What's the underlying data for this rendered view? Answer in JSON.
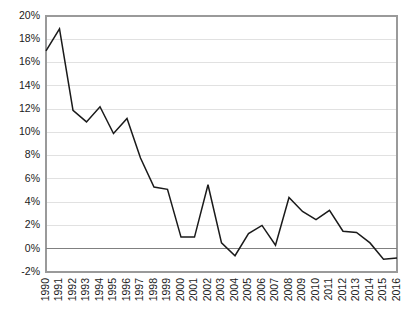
{
  "chart_data": {
    "type": "line",
    "title": "",
    "subtitle": "",
    "xlabel": "",
    "ylabel": "",
    "x": [
      1990,
      1991,
      1992,
      1993,
      1994,
      1995,
      1996,
      1997,
      1998,
      1999,
      2000,
      2001,
      2002,
      2003,
      2004,
      2005,
      2006,
      2007,
      2008,
      2009,
      2010,
      2011,
      2012,
      2013,
      2014,
      2015,
      2016
    ],
    "categories": [
      "1990",
      "1991",
      "1992",
      "1993",
      "1994",
      "1995",
      "1996",
      "1997",
      "1998",
      "1999",
      "2000",
      "2001",
      "2002",
      "2003",
      "2004",
      "2005",
      "2006",
      "2007",
      "2008",
      "2009",
      "2010",
      "2011",
      "2012",
      "2013",
      "2014",
      "2015",
      "2016"
    ],
    "values": [
      17.0,
      18.9,
      11.9,
      10.9,
      12.2,
      9.9,
      11.2,
      7.8,
      5.3,
      5.1,
      1.0,
      1.0,
      5.5,
      0.5,
      -0.6,
      1.3,
      2.0,
      0.3,
      4.4,
      3.2,
      2.5,
      3.3,
      1.5,
      1.4,
      0.5,
      -0.9,
      -0.8
    ],
    "series": [
      {
        "name": "",
        "color": "#1a1a1a",
        "values": [
          17.0,
          18.9,
          11.9,
          10.9,
          12.2,
          9.9,
          11.2,
          7.8,
          5.3,
          5.1,
          1.0,
          1.0,
          5.5,
          0.5,
          -0.6,
          1.3,
          2.0,
          0.3,
          4.4,
          3.2,
          2.5,
          3.3,
          1.5,
          1.4,
          0.5,
          -0.9,
          -0.8
        ]
      }
    ],
    "ylim": [
      -2,
      20
    ],
    "ytick_values": [
      -2,
      0,
      2,
      4,
      6,
      8,
      10,
      12,
      14,
      16,
      18,
      20
    ],
    "ytick_labels": [
      "-2%",
      "0%",
      "2%",
      "4%",
      "6%",
      "8%",
      "10%",
      "12%",
      "14%",
      "16%",
      "18%",
      "20%"
    ],
    "grid": true,
    "grid_axis": "y",
    "legend": false,
    "legend_position": "none",
    "annotations": [],
    "zero_line": 0,
    "xtick_rotation": -90,
    "colors": {
      "line": "#1a1a1a",
      "grid": "#d9d9d9",
      "zero_line": "#808080",
      "frame": "#9a9a9a",
      "background": "#ffffff",
      "text": "#1a1a1a"
    }
  },
  "layout": {
    "plot_left": 46,
    "plot_right": 397,
    "plot_top": 16,
    "plot_bottom": 272,
    "width": 409,
    "height": 314
  }
}
